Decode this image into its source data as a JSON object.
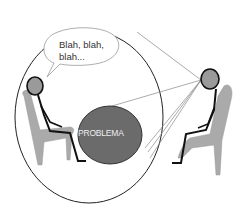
{
  "diagram": {
    "speech_bubble": {
      "line1": "Blah, blah,",
      "line2": "blah..."
    },
    "problem_label": "PROBLEMA",
    "colors": {
      "background": "#ffffff",
      "problem_fill": "#6b6b6b",
      "chair_fill": "#aaaaaa",
      "head_fill": "#9a9a9a",
      "outline": "#111111",
      "sight_lines": "#888888"
    }
  }
}
